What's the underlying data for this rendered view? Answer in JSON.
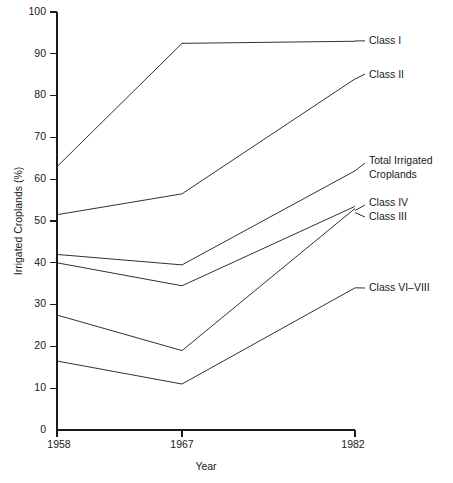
{
  "chart_data": {
    "type": "line",
    "title": "",
    "xlabel": "Year",
    "ylabel": "Irrigated Croplands (%)",
    "x": [
      1958,
      1967,
      1982
    ],
    "categories": [
      "1958",
      "1967",
      "1982"
    ],
    "xticklabels": [
      "1958",
      "1967",
      "1982"
    ],
    "yticklabels": [
      "0",
      "10",
      "20",
      "30",
      "40",
      "50",
      "60",
      "70",
      "80",
      "90",
      "100"
    ],
    "yticks": [
      0,
      10,
      20,
      30,
      40,
      50,
      60,
      70,
      80,
      90,
      100
    ],
    "ylim": [
      0,
      100
    ],
    "grid": false,
    "legend_position": "right-inline-labels",
    "series": [
      {
        "name": "Class I",
        "values": [
          63,
          92.5,
          93
        ]
      },
      {
        "name": "Class II",
        "values": [
          51.5,
          56.5,
          84
        ]
      },
      {
        "name": "Total Irrigated Croplands",
        "values": [
          42,
          39.5,
          62
        ]
      },
      {
        "name": "Class IV",
        "values": [
          40,
          34.5,
          53.5
        ]
      },
      {
        "name": "Class III",
        "values": [
          27.5,
          19,
          53
        ]
      },
      {
        "name": "Class VI–VIII",
        "values": [
          16.5,
          11,
          34
        ]
      }
    ]
  },
  "labels": {
    "class_i": "Class I",
    "class_ii": "Class II",
    "total_irrigated_line1": "Total Irrigated",
    "total_irrigated_line2": "Croplands",
    "class_iv": "Class IV",
    "class_iii": "Class III",
    "class_vi_viii": "Class VI–VIII"
  },
  "ytick_labels": {
    "t100": "100",
    "t90": "90",
    "t80": "80",
    "t70": "70",
    "t60": "60",
    "t50": "50",
    "t40": "40",
    "t30": "30",
    "t20": "20",
    "t10": "10",
    "t0": "0"
  },
  "xtick_labels": {
    "x1958": "1958",
    "x1967": "1967",
    "x1982": "1982"
  },
  "axis_titles": {
    "x": "Year",
    "y": "Irrigated Croplands (%)"
  },
  "colors": {
    "ink": "#1a1a1a",
    "background": "#ffffff"
  }
}
